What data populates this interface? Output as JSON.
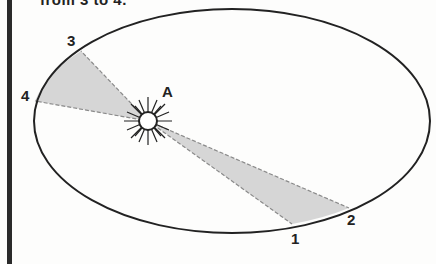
{
  "caption": "from 3 to 4.",
  "diagram": {
    "type": "Kepler second law orbit",
    "focus_label": "A",
    "points": [
      {
        "id": "1",
        "label": "1"
      },
      {
        "id": "2",
        "label": "2"
      },
      {
        "id": "3",
        "label": "3"
      },
      {
        "id": "4",
        "label": "4"
      }
    ],
    "colors": {
      "orbit": "#222222",
      "sector_fill": "#d6d6d6",
      "sector_edge": "#8a8a8a",
      "sun": "#222222",
      "bar": "#2a2a2a"
    }
  }
}
